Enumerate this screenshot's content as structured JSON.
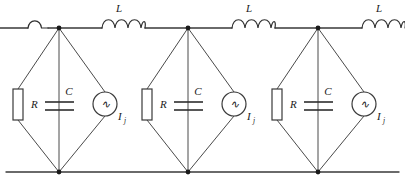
{
  "figure": {
    "type": "circuit-diagram",
    "title": "",
    "background_color": "#ffffff",
    "line_color": "#3a3a3a"
  },
  "labels": {
    "inductor": "L",
    "resistor": "R",
    "capacitor": "C",
    "source_symbol": "∿",
    "source_current": "I",
    "source_subscript": "j"
  },
  "topology": {
    "top_rail_y": 28,
    "bottom_rail_y": 172,
    "node_x": [
      59,
      188,
      318
    ],
    "cell_count": 3,
    "inductor_count_visible": 4
  },
  "inductors": [
    {
      "name": "L-left-partial",
      "label": "",
      "x_start": 28,
      "x_end": 48,
      "bumps": 1,
      "partial": true
    },
    {
      "name": "L-1",
      "label": "L",
      "x_start": 102,
      "x_end": 145,
      "bumps": 4,
      "partial": false
    },
    {
      "name": "L-2",
      "label": "L",
      "x_start": 232,
      "x_end": 275,
      "bumps": 4,
      "partial": false
    },
    {
      "name": "L-3",
      "label": "L",
      "x_start": 362,
      "x_end": 405,
      "bumps": 4,
      "partial": true
    }
  ],
  "cells": [
    {
      "name": "cell-1",
      "node_x": 59,
      "resistor": {
        "label": "R",
        "cx": 18,
        "cy": 104
      },
      "capacitor": {
        "label": "C",
        "cx": 59,
        "cy": 106
      },
      "source": {
        "label": "I",
        "subscript": "j",
        "cx": 105,
        "cy": 104
      }
    },
    {
      "name": "cell-2",
      "node_x": 188,
      "resistor": {
        "label": "R",
        "cx": 147,
        "cy": 104
      },
      "capacitor": {
        "label": "C",
        "cx": 188,
        "cy": 106
      },
      "source": {
        "label": "I",
        "subscript": "j",
        "cx": 234,
        "cy": 104
      }
    },
    {
      "name": "cell-3",
      "node_x": 318,
      "resistor": {
        "label": "R",
        "cx": 277,
        "cy": 104
      },
      "capacitor": {
        "label": "C",
        "cx": 318,
        "cy": 106
      },
      "source": {
        "label": "I",
        "subscript": "j",
        "cx": 364,
        "cy": 104
      }
    }
  ]
}
